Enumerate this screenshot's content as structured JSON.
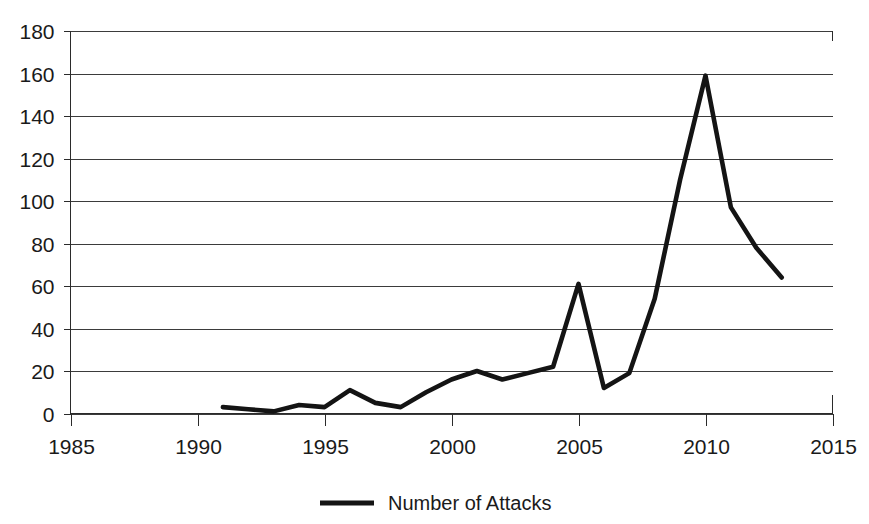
{
  "chart_data": {
    "type": "line",
    "title": "",
    "subtitle": "",
    "xlabel": "",
    "ylabel": "",
    "xlim": [
      1985,
      2015
    ],
    "ylim": [
      0,
      180
    ],
    "grid": true,
    "legend_position": "bottom",
    "legend": [
      "Number of Attacks"
    ],
    "x_ticks": [
      "1985",
      "1990",
      "1995",
      "2000",
      "2005",
      "2010",
      "2015"
    ],
    "x_tick_values": [
      1985,
      1990,
      1995,
      2000,
      2005,
      2010,
      2015
    ],
    "y_ticks": [
      "0",
      "20",
      "40",
      "60",
      "80",
      "100",
      "120",
      "140",
      "160",
      "180"
    ],
    "y_tick_values": [
      0,
      20,
      40,
      60,
      80,
      100,
      120,
      140,
      160,
      180
    ],
    "x": [
      1991,
      1992,
      1993,
      1994,
      1995,
      1996,
      1997,
      1998,
      1999,
      2000,
      2001,
      2002,
      2003,
      2004,
      2005,
      2006,
      2007,
      2008,
      2009,
      2010,
      2011,
      2012,
      2013
    ],
    "series": [
      {
        "name": "Number of Attacks",
        "color": "#141414",
        "values": [
          3,
          2,
          1,
          4,
          3,
          11,
          5,
          3,
          10,
          16,
          20,
          16,
          19,
          22,
          61,
          12,
          19,
          54,
          110,
          159,
          97,
          78,
          64
        ]
      }
    ]
  },
  "axes": {
    "y_axis_name": "y-axis",
    "x_axis_name": "x-axis"
  },
  "legend_entry": {
    "label": "Number of Attacks"
  }
}
